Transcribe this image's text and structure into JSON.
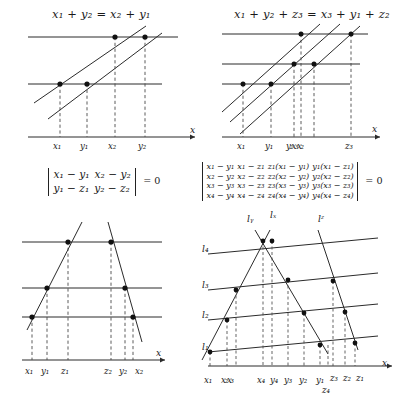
{
  "figure": {
    "domain": "mathematical-diagram",
    "stroke": "#2b2b2b",
    "dash": "#4a4a4a",
    "dot": "#111111"
  },
  "panels": {
    "top_left": {
      "title": "x₁ + y₂ = x₂ + y₁",
      "title_parts": [
        "x",
        "1",
        "+",
        "y",
        "2",
        "=",
        "x",
        "2",
        "+",
        "y",
        "1"
      ],
      "axis_label": "x",
      "tick_labels": [
        "x₁",
        "y₁",
        "x₂",
        "y₂"
      ],
      "horizontal_lines": 3,
      "transversal_lines": 2,
      "intersection_dots": 4
    },
    "top_right": {
      "title": "x₁ + y₂ + z₃ = x₃ + y₁ + z₂",
      "axis_label": "x",
      "tick_labels": [
        "x₁",
        "y₁",
        "y₂x₃x₂",
        "z₃"
      ],
      "tick_labels_expanded": [
        "x₁",
        "y₁",
        "y₂",
        "x₃",
        "x₂",
        "z₃"
      ],
      "horizontal_lines": 3,
      "transversal_lines": 3,
      "intersection_dots": 6
    },
    "bottom_left": {
      "axis_label": "x",
      "tick_labels": [
        "x₁",
        "y₁",
        "z₁",
        "z₂",
        "y₂",
        "x₂"
      ],
      "horizontal_lines": 3,
      "transversal_lines": 2,
      "intersection_dots": 6
    },
    "bottom_right": {
      "axis_label": "x",
      "line_labels_left": [
        "l₁",
        "l₂",
        "l₃",
        "l₄"
      ],
      "line_labels_top": [
        "lᵧ",
        "lₓ",
        "lᶻ"
      ],
      "line_labels_top_raw": [
        "l_y",
        "l_x",
        "l_z"
      ],
      "tick_labels_row1": [
        "x₁",
        "x₂x₃",
        "x₄",
        "y₄",
        "y₃",
        "y₂",
        "y₁",
        "z₃",
        "z₂",
        "z₁"
      ],
      "tick_labels_row2": [
        "z₄"
      ],
      "slanted_lines": 4,
      "transversal_lines": 3
    }
  },
  "equations": {
    "det2": {
      "rows": [
        [
          "x₁ − y₁",
          "x₂ − y₂"
        ],
        [
          "y₁ − z₁",
          "y₂ − z₂"
        ]
      ],
      "rhs": "= 0"
    },
    "det4": {
      "rows": [
        [
          "x₁ − y₁",
          "x₁ − z₁",
          "z₁(x₁ − y₁)",
          "y₁(x₁ − z₁)"
        ],
        [
          "x₂ − y₂",
          "x₂ − z₂",
          "z₂(x₂ − y₂)",
          "y₂(x₂ − z₂)"
        ],
        [
          "x₃ − y₃",
          "x₃ − z₃",
          "z₃(x₃ − y₃)",
          "y₃(x₃ − z₃)"
        ],
        [
          "x₄ − y₄",
          "x₄ − z₄",
          "z₄(x₄ − y₄)",
          "y₄(x₄ − z₄)"
        ]
      ],
      "rhs": "= 0"
    }
  }
}
